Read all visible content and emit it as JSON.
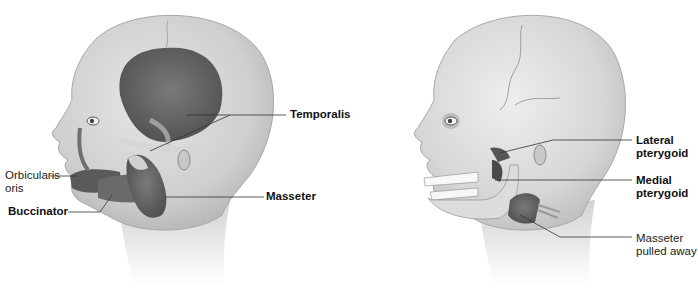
{
  "figure": {
    "left_panel": {
      "labels": {
        "orbicularis_line1": "Orbicularis",
        "orbicularis_line2": "oris",
        "buccinator": "Buccinator",
        "temporalis": "Temporalis",
        "masseter": "Masseter"
      }
    },
    "right_panel": {
      "labels": {
        "lateral_line1": "Lateral",
        "lateral_line2": "pterygoid",
        "medial_line1": "Medial",
        "medial_line2": "pterygoid",
        "masseter_pulled_line1": "Masseter",
        "masseter_pulled_line2": "pulled away"
      }
    },
    "colors": {
      "skin": "#d9d9d9",
      "skin_dark": "#bdbdbd",
      "muscle": "#6a6a6a",
      "muscle_dark": "#4e4e4e",
      "bone": "#e4e4e4",
      "leader_line": "#333333"
    }
  }
}
